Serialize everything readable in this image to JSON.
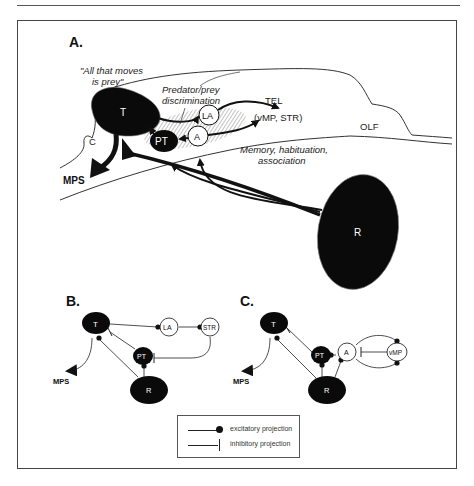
{
  "figure": {
    "panels": {
      "A": {
        "label": "A.",
        "nodes": {
          "T": "T",
          "PT": "PT",
          "LA": "LA",
          "A": "A",
          "R": "R",
          "C": "C"
        },
        "annotations": {
          "all_that_moves_line1": "\"All that moves",
          "all_that_moves_line2": "is prey\"",
          "predator_line1": "Predator/prey",
          "predator_line2": "discrimination",
          "tel": "TEL",
          "tel_sub": "(vMP, STR)",
          "olf": "OLF",
          "memory_line1": "Memory, habituation,",
          "memory_line2": "association",
          "mps": "MPS"
        }
      },
      "B": {
        "label": "B.",
        "nodes": {
          "T": "T",
          "LA": "LA",
          "STR": "STR",
          "PT": "PT",
          "R": "R"
        },
        "mps": "MPS"
      },
      "C": {
        "label": "C.",
        "nodes": {
          "T": "T",
          "PT": "PT",
          "A": "A",
          "vMP": "vMP",
          "R": "R"
        },
        "mps": "MPS"
      }
    },
    "legend": {
      "excitatory": "excitatory projection",
      "inhibitory": "inhibitory projection"
    },
    "colors": {
      "ink": "#111111",
      "frame": "#444444",
      "hatch": "#9a9a9a"
    }
  }
}
